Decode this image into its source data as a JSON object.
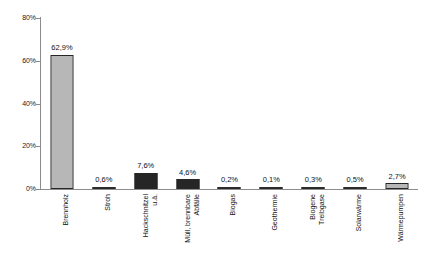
{
  "chart_data": {
    "type": "bar",
    "title": "",
    "subtitle": "",
    "xlabel": "",
    "ylabel": "",
    "ylim": [
      0,
      80
    ],
    "y_tick_labels": [
      "0%",
      "20%",
      "40%",
      "60%",
      "80%"
    ],
    "y_ticks": [
      0,
      20,
      40,
      60,
      80
    ],
    "grid": false,
    "legend": null,
    "categories": [
      "Brennholz",
      "Stroh",
      "Hackschnitzel u.ä.",
      "Müll, brennbare Abfälle",
      "Biogas",
      "Geothermie",
      "Biogene Treibgase",
      "Solarwärme",
      "Wärmepumpen"
    ],
    "category_lines": [
      [
        "Brennholz"
      ],
      [
        "Stroh"
      ],
      [
        "Hackschnitzel",
        "u.ä."
      ],
      [
        "Müll, brennbare",
        "Abfälle"
      ],
      [
        "Biogas"
      ],
      [
        "Geothermie"
      ],
      [
        "Biogene",
        "Treibgase"
      ],
      [
        "Solarwärme"
      ],
      [
        "Wärmepumpen"
      ]
    ],
    "values": [
      62.9,
      0.6,
      7.6,
      4.6,
      0.2,
      0.1,
      0.3,
      0.5,
      2.7
    ],
    "value_labels": [
      "62,9%",
      "0,6%",
      "7,6%",
      "4,6%",
      "0,2%",
      "0,1%",
      "0,3%",
      "0,5%",
      "2,7%"
    ],
    "bar_fills": [
      "checker",
      "thin",
      "solid",
      "solid",
      "thin",
      "thin",
      "thin",
      "thin",
      "checker"
    ],
    "colors": {
      "bar_pattern_gray": "#6e6e6e",
      "bar_solid_dark": "#262626",
      "axis": "#8c8c8c",
      "text": "#111111",
      "background": "#ffffff"
    }
  }
}
